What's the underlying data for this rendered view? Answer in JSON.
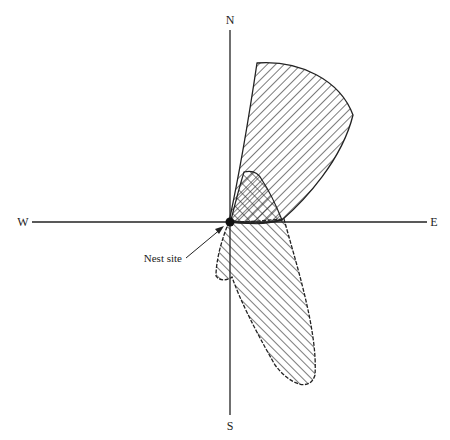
{
  "diagram": {
    "type": "orientation-rose",
    "compass": {
      "north": "N",
      "south": "S",
      "east": "E",
      "west": "W"
    },
    "annotation": {
      "label": "Nest site"
    },
    "regions": [
      {
        "id": "upper-lobe",
        "fill": "diagonal-hatch",
        "direction": "NNE"
      },
      {
        "id": "lower-lobe",
        "fill": "diagonal-hatch",
        "direction": "SSE"
      },
      {
        "id": "overlap",
        "fill": "cross-hatch",
        "direction": "NNE-near-origin"
      }
    ],
    "colors": {
      "ink": "#222222",
      "background": "#ffffff"
    }
  }
}
